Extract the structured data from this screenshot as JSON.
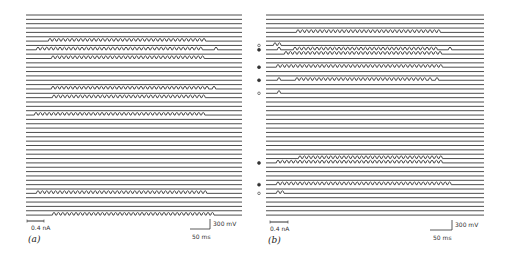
{
  "figure": {
    "trace_color": "#3a3a3a",
    "marker_color": "#333333",
    "panels": [
      {
        "id": "a",
        "label": "(a)",
        "x_start": 26,
        "x_end": 242,
        "y_first": 15,
        "line_count": 47,
        "line_spacing": 4.35,
        "current_scale_label": "0.4 nA",
        "voltage_scale_label": "300 mV",
        "time_scale_label": "50 ms",
        "spike_rows": [
          {
            "row": 6,
            "from": 50,
            "to": 207,
            "extra": []
          },
          {
            "row": 8,
            "from": 38,
            "to": 203,
            "extra": [
              216
            ]
          },
          {
            "row": 10,
            "from": 53,
            "to": 204,
            "extra": []
          },
          {
            "row": 17,
            "from": 53,
            "to": 211,
            "extra": [
              214
            ]
          },
          {
            "row": 19,
            "from": 54,
            "to": 207,
            "extra": []
          },
          {
            "row": 23,
            "from": 36,
            "to": 207,
            "extra": []
          },
          {
            "row": 41,
            "from": 38,
            "to": 207,
            "extra": []
          },
          {
            "row": 46,
            "from": 54,
            "to": 215,
            "extra": []
          }
        ],
        "markers": []
      },
      {
        "id": "b",
        "label": "(b)",
        "x_start": 266,
        "x_end": 484,
        "y_first": 15,
        "line_count": 47,
        "line_spacing": 4.35,
        "current_scale_label": "0.4 nA",
        "voltage_scale_label": "300 mV",
        "time_scale_label": "50 ms",
        "spike_rows": [
          {
            "row": 4,
            "from": 298,
            "to": 443,
            "extra": []
          },
          {
            "row": 7,
            "from": 275,
            "to": 283,
            "extra": []
          },
          {
            "row": 8,
            "from": 295,
            "to": 437,
            "extra": [
              279,
              450
            ]
          },
          {
            "row": 9,
            "from": 286,
            "to": 443,
            "extra": []
          },
          {
            "row": 12,
            "from": 278,
            "to": 443,
            "extra": []
          },
          {
            "row": 15,
            "from": 297,
            "to": 425,
            "extra": [
              279,
              430,
              437
            ]
          },
          {
            "row": 18,
            "from": 279,
            "to": 279,
            "extra": []
          },
          {
            "row": 33,
            "from": 300,
            "to": 443,
            "extra": []
          },
          {
            "row": 34,
            "from": 278,
            "to": 443,
            "extra": []
          },
          {
            "row": 39,
            "from": 278,
            "to": 452,
            "extra": []
          },
          {
            "row": 41,
            "from": 278,
            "to": 284,
            "extra": []
          }
        ],
        "markers": [
          {
            "row": 7,
            "type": "open",
            "x": 259
          },
          {
            "row": 8,
            "type": "filled",
            "x": 259
          },
          {
            "row": 12,
            "type": "filled",
            "x": 259
          },
          {
            "row": 15,
            "type": "filled",
            "x": 259
          },
          {
            "row": 18,
            "type": "open",
            "x": 259
          },
          {
            "row": 34,
            "type": "filled",
            "x": 259
          },
          {
            "row": 39,
            "type": "filled",
            "x": 259
          },
          {
            "row": 41,
            "type": "open",
            "x": 259
          }
        ]
      }
    ]
  }
}
